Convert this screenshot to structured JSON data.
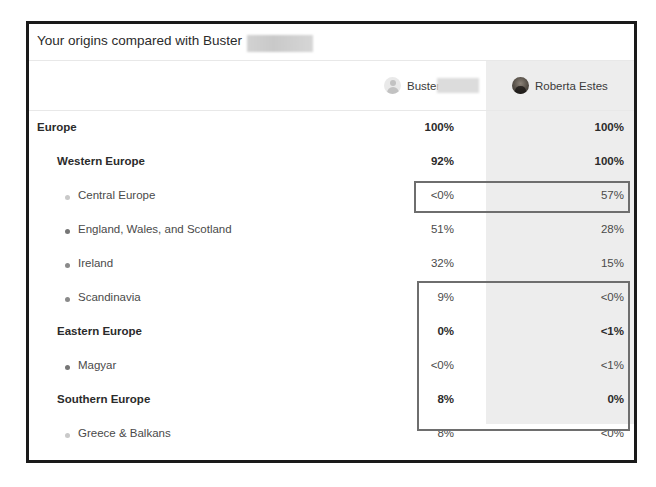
{
  "card": {
    "title": "Your origins compared with Buster",
    "title_redacted": true
  },
  "columns": [
    {
      "id": "buster",
      "name": "Buster",
      "avatar": "person-placeholder-avatar",
      "redacted_surname": true
    },
    {
      "id": "roberta",
      "name": "Roberta Estes",
      "avatar": "photo-avatar",
      "redacted_surname": false
    }
  ],
  "rows": [
    {
      "label": "Europe",
      "level": 1,
      "dot": null,
      "buster": "100%",
      "roberta": "100%"
    },
    {
      "label": "Western Europe",
      "level": 2,
      "dot": null,
      "buster": "92%",
      "roberta": "100%"
    },
    {
      "label": "Central Europe",
      "level": 3,
      "dot": "#c9c9c9",
      "buster": "<0%",
      "roberta": "57%"
    },
    {
      "label": "England, Wales, and Scotland",
      "level": 3,
      "dot": "#767676",
      "buster": "51%",
      "roberta": "28%"
    },
    {
      "label": "Ireland",
      "level": 3,
      "dot": "#8a8a8a",
      "buster": "32%",
      "roberta": "15%"
    },
    {
      "label": "Scandinavia",
      "level": 3,
      "dot": "#8a8a8a",
      "buster": "9%",
      "roberta": "<0%"
    },
    {
      "label": "Eastern Europe",
      "level": 2,
      "dot": null,
      "buster": "0%",
      "roberta": "<1%"
    },
    {
      "label": "Magyar",
      "level": 3,
      "dot": "#767676",
      "buster": "<0%",
      "roberta": "<1%"
    },
    {
      "label": "Southern Europe",
      "level": 2,
      "dot": null,
      "buster": "8%",
      "roberta": "0%"
    },
    {
      "label": "Greece & Balkans",
      "level": 3,
      "dot": "#c9c9c9",
      "buster": "8%",
      "roberta": "<0%"
    }
  ],
  "highlights": [
    {
      "id": "highlight-central-europe",
      "rows": [
        2
      ]
    },
    {
      "id": "highlight-scandinavia-to-greece",
      "rows": [
        5,
        6,
        7,
        8,
        9
      ]
    }
  ],
  "style": {
    "shaded_column_color": "#ededed",
    "border_color": "#1a1a1a",
    "highlight_border_color": "#6e6e6e"
  }
}
